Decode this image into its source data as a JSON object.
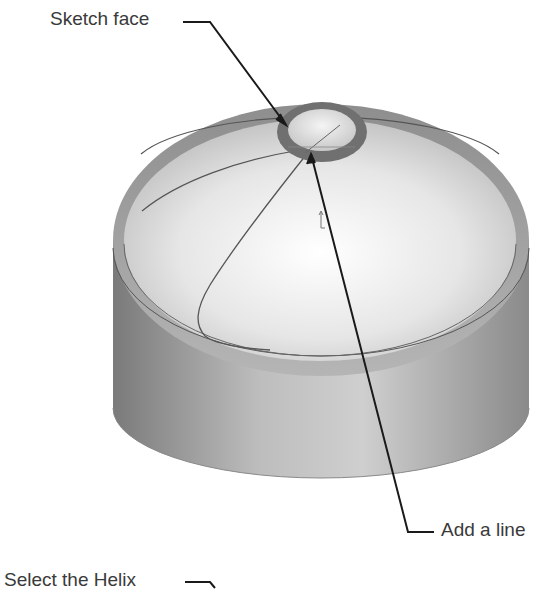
{
  "callouts": {
    "sketch_face": "Sketch face",
    "add_a_line": "Add a line",
    "select_helix": "Select the Helix"
  },
  "colors": {
    "background": "#ffffff",
    "label_text": "#3a3a3a",
    "leader_line": "#1a1a1a",
    "model_dark": "#6e6e6e",
    "model_light": "#f2f2f2"
  }
}
